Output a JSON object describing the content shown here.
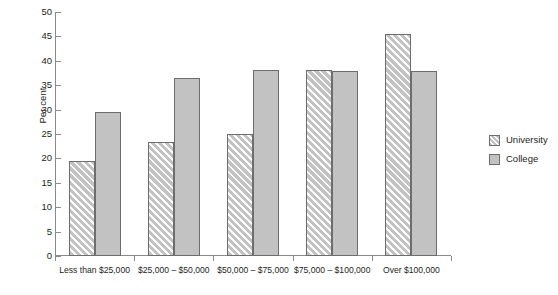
{
  "chart_data": {
    "type": "bar",
    "title": "",
    "xlabel": "",
    "ylabel": "Per cent",
    "ylim": [
      0,
      50
    ],
    "yticks": [
      0,
      5,
      10,
      15,
      20,
      25,
      30,
      35,
      40,
      45,
      50
    ],
    "grid": false,
    "legend_position": "right",
    "categories": [
      "Less than $25,000",
      "$25,000 – $50,000",
      "$50,000 – $75,000",
      "$75,000 – $100,000",
      "Over $100,000"
    ],
    "series": [
      {
        "name": "University",
        "fill": "hatched",
        "values": [
          19.5,
          23.4,
          25.0,
          38.2,
          45.5
        ]
      },
      {
        "name": "College",
        "fill": "solid",
        "values": [
          29.5,
          36.4,
          38.2,
          38.0,
          38.0
        ]
      }
    ],
    "colors": {
      "bar_fill": "#c2c2c2",
      "bar_edge": "#6d6d6d",
      "axis": "#8a8a8a",
      "text": "#231f20",
      "background": "#ffffff"
    }
  }
}
